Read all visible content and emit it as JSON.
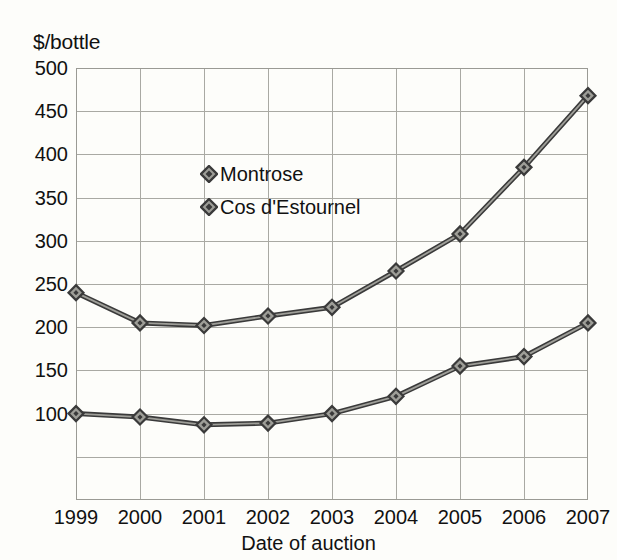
{
  "chart_data": {
    "type": "line",
    "title": "",
    "subtitle": "",
    "xlabel": "Date of auction",
    "ylabel": "$/bottle",
    "x": [
      1999,
      2000,
      2001,
      2002,
      2003,
      2004,
      2005,
      2006,
      2007
    ],
    "categories": [
      "1999",
      "2000",
      "2001",
      "2002",
      "2003",
      "2004",
      "2005",
      "2006",
      "2007"
    ],
    "series": [
      {
        "name": "Montrose",
        "marker": "diamond",
        "color": "#3a3a3a",
        "values": [
          240,
          205,
          202,
          213,
          223,
          265,
          308,
          385,
          468
        ]
      },
      {
        "name": "Cos d'Estournel",
        "marker": "diamond",
        "color": "#4a4a4a",
        "values": [
          100,
          96,
          87,
          89,
          100,
          120,
          155,
          166,
          205
        ]
      }
    ],
    "ylim": [
      0,
      500
    ],
    "xlim": [
      1999,
      2007
    ],
    "yticks": [
      0,
      50,
      100,
      150,
      200,
      250,
      300,
      350,
      400,
      450,
      500
    ],
    "ytick_labels": [
      "",
      "",
      "100",
      "150",
      "200",
      "250",
      "300",
      "350",
      "400",
      "450",
      "500"
    ],
    "ytick_labels_visible": [
      "100",
      "150",
      "200",
      "250",
      "300",
      "350",
      "400",
      "450",
      "500"
    ],
    "grid": true,
    "grid_axes": "both",
    "legend_position": "inside-upper-left"
  },
  "axes": {
    "y_title": "$/bottle",
    "x_title": "Date of auction",
    "y_ticks": [
      {
        "value": 500,
        "label": "500"
      },
      {
        "value": 450,
        "label": "450"
      },
      {
        "value": 400,
        "label": "400"
      },
      {
        "value": 350,
        "label": "350"
      },
      {
        "value": 300,
        "label": "300"
      },
      {
        "value": 250,
        "label": "250"
      },
      {
        "value": 200,
        "label": "200"
      },
      {
        "value": 150,
        "label": "150"
      },
      {
        "value": 100,
        "label": "100"
      },
      {
        "value": 50,
        "label": ""
      },
      {
        "value": 0,
        "label": ""
      }
    ],
    "x_ticks": [
      {
        "value": 1999,
        "label": "1999"
      },
      {
        "value": 2000,
        "label": "2000"
      },
      {
        "value": 2001,
        "label": "2001"
      },
      {
        "value": 2002,
        "label": "2002"
      },
      {
        "value": 2003,
        "label": "2003"
      },
      {
        "value": 2004,
        "label": "2004"
      },
      {
        "value": 2005,
        "label": "2005"
      },
      {
        "value": 2006,
        "label": "2006"
      },
      {
        "value": 2007,
        "label": "2007"
      }
    ]
  },
  "legend": {
    "entries": [
      {
        "label": "Montrose",
        "marker": "diamond-icon",
        "color": "#3a3a3a"
      },
      {
        "label": "Cos d'Estournel",
        "marker": "diamond-icon",
        "color": "#4a4a4a"
      }
    ]
  },
  "colors": {
    "background": "#fdfdfa",
    "grid": "#a9a9a3",
    "axis": "#9a9a94",
    "text": "#111111",
    "series_line": "#3a3a3a",
    "marker_fill": "#9e9e98"
  }
}
